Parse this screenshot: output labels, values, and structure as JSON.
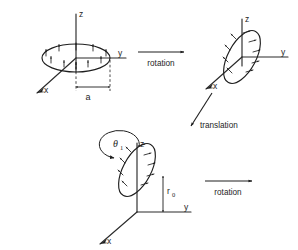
{
  "figure": {
    "background_color": "#ffffff",
    "ink_color": "#1e1e1e",
    "width": 298,
    "height": 250
  },
  "panels": [
    {
      "id": "panel-initial",
      "name": "initial-loop-in-xy-plane",
      "axes": {
        "x": "x",
        "y": "y",
        "z": "z"
      },
      "loop": {
        "orientation": "horizontal",
        "arrow_count": 10,
        "arrow_direction": "outward-radial"
      },
      "dimension": {
        "label": "a",
        "meaning": "loop radius"
      }
    },
    {
      "id": "panel-rotated",
      "name": "rotated-loop",
      "axes": {
        "x": "x",
        "y": "y",
        "z": "z"
      },
      "loop": {
        "orientation": "tilted",
        "arrow_count": 9,
        "arrow_direction": "outward-normal"
      }
    },
    {
      "id": "panel-translated",
      "name": "translated-rotated-loop",
      "axes": {
        "x": "x",
        "y": "y",
        "z": "z"
      },
      "loop": {
        "orientation": "tilted",
        "arrow_count": 9,
        "arrow_direction": "outward-normal"
      },
      "angle": {
        "symbol": "θ",
        "subscript": "1"
      },
      "offset": {
        "symbol": "r",
        "subscript": "0",
        "meaning": "height along z"
      }
    }
  ],
  "operations": [
    {
      "id": "op-rotation-1",
      "label": "rotation",
      "direction": "right"
    },
    {
      "id": "op-translation",
      "label": "translation",
      "direction": "down-right"
    },
    {
      "id": "op-rotation-2",
      "label": "rotation",
      "direction": "right"
    }
  ]
}
